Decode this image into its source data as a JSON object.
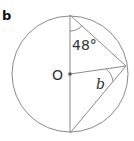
{
  "figure": {
    "part_label": "b",
    "center_label": "O",
    "angle_given": "48°",
    "angle_unknown": "b",
    "colors": {
      "stroke": "#8a8a8a",
      "text": "#333333",
      "point": "#555555"
    },
    "geometry": {
      "center": [
        70,
        74
      ],
      "radius": 58,
      "top": [
        70,
        15
      ],
      "bottom": [
        70,
        133
      ],
      "right_point": [
        126,
        66
      ]
    }
  }
}
